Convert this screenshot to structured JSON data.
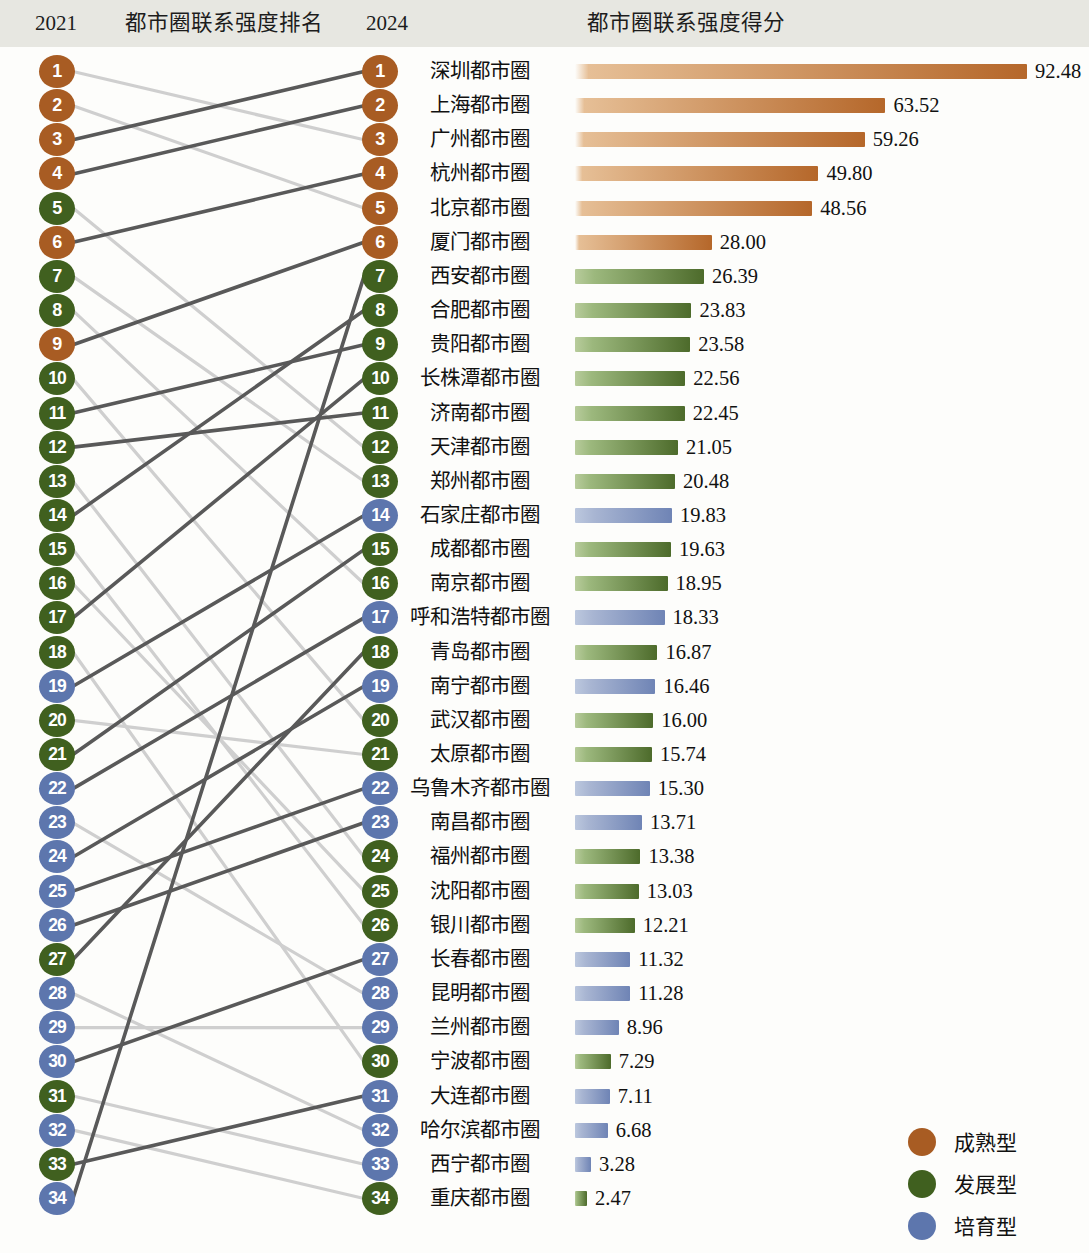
{
  "header": {
    "year_left": "2021",
    "title_middle": "都市圈联系强度排名",
    "year_right": "2024",
    "title_right": "都市圈联系强度得分"
  },
  "colors": {
    "mature": "#a85c23",
    "developing": "#40601f",
    "cultivating": "#5d76ad",
    "header_band": "#e7e7e1",
    "line_dark": "#595959",
    "line_light": "#cfcfcf"
  },
  "legend": {
    "items": [
      {
        "label": "成熟型",
        "color": "#a85c23",
        "type": "mature"
      },
      {
        "label": "发展型",
        "color": "#40601f",
        "type": "developing"
      },
      {
        "label": "培育型",
        "color": "#5d76ad",
        "type": "cultivating"
      }
    ]
  },
  "chart_data": {
    "type": "bar",
    "title": "都市圈联系强度得分",
    "xlabel": "",
    "ylabel": "",
    "xlim": [
      0,
      92.48
    ],
    "grid": false,
    "legend_position": "bottom-right",
    "categories": [
      "深圳都市圈",
      "上海都市圈",
      "广州都市圈",
      "杭州都市圈",
      "北京都市圈",
      "厦门都市圈",
      "西安都市圈",
      "合肥都市圈",
      "贵阳都市圈",
      "长株潭都市圈",
      "济南都市圈",
      "天津都市圈",
      "郑州都市圈",
      "石家庄都市圈",
      "成都都市圈",
      "南京都市圈",
      "呼和浩特都市圈",
      "青岛都市圈",
      "南宁都市圈",
      "武汉都市圈",
      "太原都市圈",
      "乌鲁木齐都市圈",
      "南昌都市圈",
      "福州都市圈",
      "沈阳都市圈",
      "银川都市圈",
      "长春都市圈",
      "昆明都市圈",
      "兰州都市圈",
      "宁波都市圈",
      "大连都市圈",
      "哈尔滨都市圈",
      "西宁都市圈",
      "重庆都市圈"
    ],
    "values": [
      92.48,
      63.52,
      59.26,
      49.8,
      48.56,
      28.0,
      26.39,
      23.83,
      23.58,
      22.56,
      22.45,
      21.05,
      20.48,
      19.83,
      19.63,
      18.95,
      18.33,
      16.87,
      16.46,
      16.0,
      15.74,
      15.3,
      13.71,
      13.38,
      13.03,
      12.21,
      11.32,
      11.28,
      8.96,
      7.29,
      7.11,
      6.68,
      3.28,
      2.47
    ],
    "value_labels": [
      "92.48",
      "63.52",
      "59.26",
      "49.80",
      "48.56",
      "28.00",
      "26.39",
      "23.83",
      "23.58",
      "22.56",
      "22.45",
      "21.05",
      "20.48",
      "19.83",
      "19.63",
      "18.95",
      "18.33",
      "16.87",
      "16.46",
      "16.00",
      "15.74",
      "15.30",
      "13.71",
      "13.38",
      "13.03",
      "12.21",
      "11.32",
      "11.28",
      "8.96",
      "7.29",
      "7.11",
      "6.68",
      "3.28",
      "2.47"
    ],
    "types_2024": [
      "mature",
      "mature",
      "mature",
      "mature",
      "mature",
      "mature",
      "developing",
      "developing",
      "developing",
      "developing",
      "developing",
      "developing",
      "developing",
      "cultivating",
      "developing",
      "developing",
      "cultivating",
      "developing",
      "cultivating",
      "developing",
      "developing",
      "cultivating",
      "cultivating",
      "developing",
      "developing",
      "developing",
      "cultivating",
      "cultivating",
      "cultivating",
      "developing",
      "cultivating",
      "cultivating",
      "cultivating",
      "developing"
    ],
    "ranks_2024": [
      1,
      2,
      3,
      4,
      5,
      6,
      7,
      8,
      9,
      10,
      11,
      12,
      13,
      14,
      15,
      16,
      17,
      18,
      19,
      20,
      21,
      22,
      23,
      24,
      25,
      26,
      27,
      28,
      29,
      30,
      31,
      32,
      33,
      34
    ],
    "ranks_2021": [
      1,
      2,
      3,
      4,
      5,
      6,
      7,
      8,
      9,
      10,
      11,
      12,
      13,
      14,
      15,
      16,
      17,
      18,
      19,
      20,
      21,
      22,
      23,
      24,
      25,
      26,
      27,
      28,
      29,
      30,
      31,
      32,
      33,
      34
    ],
    "types_2021": [
      "mature",
      "mature",
      "mature",
      "mature",
      "developing",
      "mature",
      "developing",
      "developing",
      "mature",
      "developing",
      "developing",
      "developing",
      "developing",
      "developing",
      "developing",
      "developing",
      "developing",
      "developing",
      "cultivating",
      "developing",
      "developing",
      "cultivating",
      "cultivating",
      "cultivating",
      "cultivating",
      "cultivating",
      "developing",
      "cultivating",
      "cultivating",
      "cultivating",
      "developing",
      "cultivating",
      "developing",
      "cultivating"
    ],
    "links": [
      {
        "from": 1,
        "to": 3,
        "style": "light"
      },
      {
        "from": 2,
        "to": 5,
        "style": "light"
      },
      {
        "from": 3,
        "to": 1,
        "style": "dark"
      },
      {
        "from": 4,
        "to": 2,
        "style": "dark"
      },
      {
        "from": 5,
        "to": 12,
        "style": "light"
      },
      {
        "from": 6,
        "to": 4,
        "style": "dark"
      },
      {
        "from": 7,
        "to": 13,
        "style": "light"
      },
      {
        "from": 8,
        "to": 16,
        "style": "light"
      },
      {
        "from": 9,
        "to": 6,
        "style": "dark"
      },
      {
        "from": 10,
        "to": 20,
        "style": "light"
      },
      {
        "from": 11,
        "to": 9,
        "style": "dark"
      },
      {
        "from": 12,
        "to": 11,
        "style": "dark"
      },
      {
        "from": 13,
        "to": 24,
        "style": "light"
      },
      {
        "from": 14,
        "to": 8,
        "style": "dark"
      },
      {
        "from": 15,
        "to": 26,
        "style": "light"
      },
      {
        "from": 16,
        "to": 25,
        "style": "light"
      },
      {
        "from": 17,
        "to": 10,
        "style": "dark"
      },
      {
        "from": 18,
        "to": 30,
        "style": "light"
      },
      {
        "from": 19,
        "to": 14,
        "style": "dark"
      },
      {
        "from": 20,
        "to": 21,
        "style": "light"
      },
      {
        "from": 21,
        "to": 15,
        "style": "dark"
      },
      {
        "from": 22,
        "to": 17,
        "style": "dark"
      },
      {
        "from": 23,
        "to": 28,
        "style": "light"
      },
      {
        "from": 24,
        "to": 19,
        "style": "dark"
      },
      {
        "from": 25,
        "to": 22,
        "style": "dark"
      },
      {
        "from": 26,
        "to": 23,
        "style": "dark"
      },
      {
        "from": 27,
        "to": 18,
        "style": "dark"
      },
      {
        "from": 28,
        "to": 32,
        "style": "light"
      },
      {
        "from": 29,
        "to": 29,
        "style": "light"
      },
      {
        "from": 30,
        "to": 27,
        "style": "dark"
      },
      {
        "from": 31,
        "to": 33,
        "style": "light"
      },
      {
        "from": 32,
        "to": 34,
        "style": "light"
      },
      {
        "from": 33,
        "to": 31,
        "style": "dark"
      },
      {
        "from": 34,
        "to": 7,
        "style": "dark"
      }
    ]
  }
}
